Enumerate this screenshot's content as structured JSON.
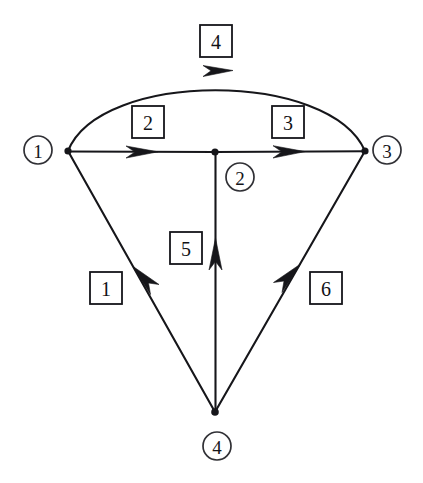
{
  "diagram": {
    "type": "directed-graph",
    "title": "",
    "background_color": "#ffffff",
    "line_color": "#16161a",
    "nodes": [
      {
        "id": "n1",
        "label": "1",
        "cx": 38,
        "cy": 150,
        "r": 14,
        "vx": 68,
        "vy": 151
      },
      {
        "id": "n2",
        "label": "2",
        "cx": 240,
        "cy": 177,
        "r": 14,
        "vx": 215,
        "vy": 152
      },
      {
        "id": "n3",
        "label": "3",
        "cx": 387,
        "cy": 150,
        "r": 14,
        "vx": 365,
        "vy": 151
      },
      {
        "id": "n4",
        "label": "4",
        "cx": 217,
        "cy": 446,
        "r": 14,
        "vx": 215,
        "vy": 412
      }
    ],
    "edges": [
      {
        "id": "e1",
        "label": "1",
        "from": "4",
        "to": "1",
        "shape": "straight",
        "box_x": 106,
        "box_y": 289
      },
      {
        "id": "e2",
        "label": "2",
        "from": "1",
        "to": "2",
        "shape": "straight",
        "box_x": 148,
        "box_y": 122
      },
      {
        "id": "e3",
        "label": "3",
        "from": "2",
        "to": "3",
        "shape": "straight",
        "box_x": 288,
        "box_y": 122
      },
      {
        "id": "e4",
        "label": "4",
        "from": "1",
        "to": "3",
        "shape": "arc",
        "box_x": 216,
        "box_y": 41
      },
      {
        "id": "e5",
        "label": "5",
        "from": "4",
        "to": "2",
        "shape": "straight",
        "box_x": 186,
        "box_y": 248
      },
      {
        "id": "e6",
        "label": "6",
        "from": "4",
        "to": "3",
        "shape": "straight",
        "box_x": 326,
        "box_y": 288
      }
    ],
    "node_labels": [
      "1",
      "2",
      "3",
      "4"
    ],
    "edge_labels": [
      "1",
      "2",
      "3",
      "4",
      "5",
      "6"
    ]
  }
}
